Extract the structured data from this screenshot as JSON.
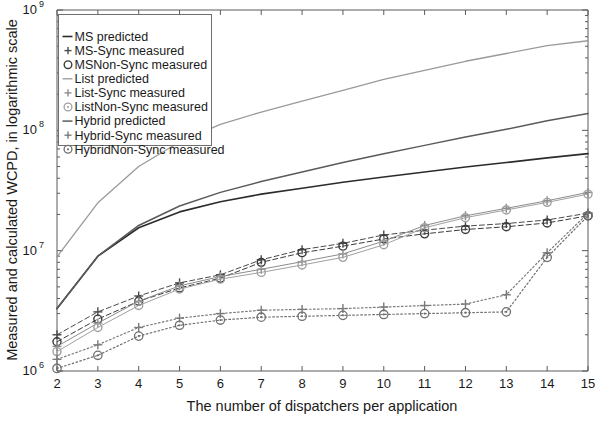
{
  "chart_data": {
    "type": "line",
    "title": "",
    "xlabel": "The number of dispatchers per application",
    "ylabel": "Measured and calculated WCPD, in logarithmic scale",
    "yscale": "log",
    "xlim": [
      2,
      15
    ],
    "ylim": [
      1000000,
      1000000000
    ],
    "grid": false,
    "legend_position": "upper left",
    "x_tick_labels": [
      "2",
      "3",
      "4",
      "5",
      "6",
      "7",
      "8",
      "9",
      "10",
      "11",
      "12",
      "13",
      "14",
      "15"
    ],
    "x": [
      2,
      3,
      4,
      5,
      6,
      7,
      8,
      9,
      10,
      11,
      12,
      13,
      14,
      15
    ],
    "y_tick_labels": [
      {
        "base": "10",
        "exp": "6"
      },
      {
        "base": "10",
        "exp": "7"
      },
      {
        "base": "10",
        "exp": "8"
      },
      {
        "base": "10",
        "exp": "9"
      }
    ],
    "series": [
      {
        "name": "MS predicted",
        "style": "solid",
        "marker": "none",
        "color": "#2b2b2b",
        "width": 1.6,
        "legend_glyph": "line",
        "values": [
          3300000.0,
          9000000.0,
          15500000.0,
          21000000.0,
          25500000.0,
          29500000.0,
          33000000.0,
          37000000.0,
          41000000.0,
          45000000.0,
          49500000.0,
          54000000.0,
          59000000.0,
          64000000.0
        ]
      },
      {
        "name": "MS-Sync measured",
        "style": "dashed",
        "marker": "plus",
        "color": "#4a4a4a",
        "width": 1.0,
        "legend_glyph": "plus",
        "values": [
          2000000.0,
          3100000.0,
          4200000.0,
          5400000.0,
          6300000.0,
          8400000.0,
          10200000.0,
          11500000.0,
          13500000.0,
          14800000.0,
          16000000.0,
          16800000.0,
          18000000.0,
          20500000.0
        ]
      },
      {
        "name": "MSNon-Sync measured",
        "style": "dashed",
        "marker": "circle",
        "color": "#3a3a3a",
        "width": 1.0,
        "legend_glyph": "circle",
        "values": [
          1750000.0,
          2700000.0,
          3800000.0,
          4900000.0,
          5900000.0,
          8000000.0,
          9600000.0,
          10900000.0,
          12500000.0,
          13800000.0,
          15000000.0,
          15800000.0,
          17000000.0,
          19500000.0
        ]
      },
      {
        "name": "List predicted",
        "style": "solid",
        "marker": "none",
        "color": "#9a9a9a",
        "width": 1.3,
        "legend_glyph": "line",
        "values": [
          8900000.0,
          25000000.0,
          50000000.0,
          80000000.0,
          112000000.0,
          142000000.0,
          175000000.0,
          215000000.0,
          265000000.0,
          315000000.0,
          375000000.0,
          435000000.0,
          505000000.0,
          555000000.0
        ]
      },
      {
        "name": "List-Sync measured",
        "style": "solid",
        "marker": "plus",
        "color": "#8c8c8c",
        "width": 1.0,
        "legend_glyph": "plus",
        "values": [
          1600000.0,
          2500000.0,
          3800000.0,
          5100000.0,
          6100000.0,
          7000000.0,
          8100000.0,
          9400000.0,
          12000000.0,
          16200000.0,
          19500000.0,
          22500000.0,
          26000000.0,
          30500000.0
        ]
      },
      {
        "name": "ListNon-Sync measured",
        "style": "solid",
        "marker": "circle",
        "color": "#a0a0a0",
        "width": 1.0,
        "legend_glyph": "circle-dot",
        "values": [
          1450000.0,
          2300000.0,
          3500000.0,
          4800000.0,
          5800000.0,
          6600000.0,
          7600000.0,
          8800000.0,
          11200000.0,
          15500000.0,
          18800000.0,
          21800000.0,
          25200000.0,
          29500000.0
        ]
      },
      {
        "name": "Hybrid predicted",
        "style": "solid",
        "marker": "none",
        "color": "#5a5a5a",
        "width": 1.5,
        "legend_glyph": "line",
        "values": [
          3300000.0,
          9000000.0,
          16200000.0,
          23500000.0,
          30500000.0,
          37500000.0,
          45000000.0,
          54000000.0,
          64000000.0,
          75000000.0,
          88000000.0,
          102000000.0,
          120000000.0,
          138000000.0
        ]
      },
      {
        "name": "Hybrid-Sync measured",
        "style": "dotted",
        "marker": "plus",
        "color": "#7a7a7a",
        "width": 1.2,
        "legend_glyph": "plus",
        "values": [
          1250000.0,
          1650000.0,
          2300000.0,
          2750000.0,
          3000000.0,
          3200000.0,
          3250000.0,
          3300000.0,
          3400000.0,
          3500000.0,
          3600000.0,
          4300000.0,
          9600000.0,
          20500000.0
        ]
      },
      {
        "name": "HybridNon-Sync measured",
        "style": "dotted",
        "marker": "circle-dot",
        "color": "#6f6f6f",
        "width": 1.2,
        "legend_glyph": "circle-dot",
        "values": [
          1050000.0,
          1350000.0,
          1950000.0,
          2400000.0,
          2650000.0,
          2800000.0,
          2850000.0,
          2900000.0,
          2950000.0,
          3000000.0,
          3050000.0,
          3100000.0,
          8800000.0,
          19500000.0
        ]
      }
    ]
  },
  "legend": {
    "items": [
      "MS predicted",
      "MS-Sync measured",
      "MSNon-Sync measured",
      "List predicted",
      "List-Sync measured",
      "ListNon-Sync measured",
      "Hybrid predicted",
      "Hybrid-Sync measured",
      "HybridNon-Sync measured"
    ]
  },
  "colors": {
    "axis": "#5a5a5a",
    "text": "#1a1a1a",
    "background": "#ffffff"
  }
}
